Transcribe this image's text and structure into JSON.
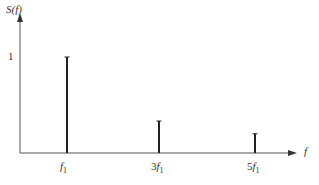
{
  "chart_data": {
    "type": "bar",
    "title": "",
    "xlabel": "f",
    "ylabel": "S(f)",
    "categories": [
      "f1",
      "3f1",
      "5f1"
    ],
    "values": [
      1,
      0.333,
      0.2
    ],
    "ytick_labels": [
      "1"
    ],
    "ylim": [
      0,
      1.3
    ],
    "grid": false,
    "legend": null,
    "style": "stem lines (spectral lines)"
  },
  "axis": {
    "ylabel_main": "S",
    "ylabel_arg": "(f)",
    "xlabel": "f",
    "ytick_1": "1"
  },
  "ticks": [
    {
      "coef": "",
      "var": "f",
      "sub": "1"
    },
    {
      "coef": "3",
      "var": "f",
      "sub": "1"
    },
    {
      "coef": "5",
      "var": "f",
      "sub": "1"
    }
  ],
  "colors": {
    "axis": "#555555",
    "stem": "#222222"
  }
}
